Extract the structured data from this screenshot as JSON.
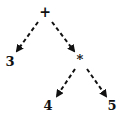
{
  "diagram": {
    "type": "expression-tree",
    "nodes": [
      {
        "id": "root",
        "label": "+",
        "x": 45,
        "y": 17,
        "size": 14
      },
      {
        "id": "left",
        "label": "3",
        "x": 10,
        "y": 66,
        "size": 13
      },
      {
        "id": "mul",
        "label": "*",
        "x": 80,
        "y": 64,
        "size": 13
      },
      {
        "id": "mul-left",
        "label": "4",
        "x": 48,
        "y": 110,
        "size": 13
      },
      {
        "id": "mul-right",
        "label": "5",
        "x": 112,
        "y": 110,
        "size": 13
      }
    ],
    "edges": [
      {
        "from": "root",
        "to": "left",
        "x1": 38,
        "y1": 22,
        "x2": 17,
        "y2": 51
      },
      {
        "from": "root",
        "to": "mul",
        "x1": 52,
        "y1": 22,
        "x2": 74,
        "y2": 51
      },
      {
        "from": "mul",
        "to": "mul-left",
        "x1": 75,
        "y1": 69,
        "x2": 57,
        "y2": 96
      },
      {
        "from": "mul",
        "to": "mul-right",
        "x1": 87,
        "y1": 69,
        "x2": 106,
        "y2": 96
      }
    ],
    "colors": {
      "stroke": "#111111",
      "background": "#ffffff"
    }
  }
}
